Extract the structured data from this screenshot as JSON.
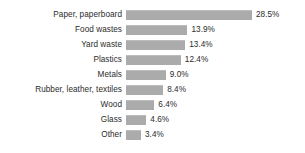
{
  "chart_data": {
    "type": "bar",
    "orientation": "horizontal",
    "title": "",
    "subtitle": "",
    "xlabel": "",
    "ylabel": "",
    "grid": false,
    "legend": false,
    "legend_position": "none",
    "xlim": [
      0,
      28.5
    ],
    "axis_visible": false,
    "bar_color": "#ababab",
    "text_color": "#2b2b2b",
    "background_color": "#ffffff",
    "categories": [
      "Paper, paperboard",
      "Food wastes",
      "Yard waste",
      "Plastics",
      "Metals",
      "Rubber, leather, textiles",
      "Wood",
      "Glass",
      "Other"
    ],
    "values": [
      28.5,
      13.9,
      13.4,
      12.4,
      9.0,
      8.4,
      6.4,
      4.6,
      3.4
    ],
    "value_labels": [
      "28.5%",
      "13.9%",
      "13.4%",
      "12.4%",
      "9.0%",
      "8.4%",
      "6.4%",
      "4.6%",
      "3.4%"
    ]
  },
  "layout": {
    "px_per_unit": 4.42,
    "row_pitch": 15,
    "first_row_top": 7,
    "bar_height": 10
  }
}
